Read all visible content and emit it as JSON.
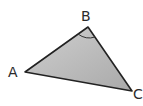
{
  "diagram": {
    "type": "triangle",
    "vertices": [
      {
        "label": "A",
        "x": 25,
        "y": 72
      },
      {
        "label": "B",
        "x": 88,
        "y": 27
      },
      {
        "label": "C",
        "x": 132,
        "y": 91
      }
    ],
    "marked_angle": "B",
    "fill_color": "#b8b8b8",
    "stroke_color": "#222222"
  },
  "labels": {
    "a": "A",
    "b": "B",
    "c": "C"
  }
}
